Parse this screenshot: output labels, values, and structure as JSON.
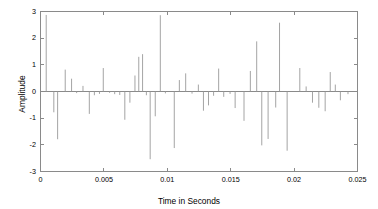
{
  "figure": {
    "background_color": "#ffffff",
    "axis_color": "#8a8a8a",
    "stem_color": "#9a9a9a",
    "text_color": "#3c3c3c"
  },
  "chart_data": {
    "type": "bar",
    "title": "",
    "subtitle": "",
    "xlabel": "Time in Seconds",
    "ylabel": "Amplitude",
    "xlim": [
      0,
      0.025
    ],
    "ylim": [
      -3,
      3
    ],
    "xticks": [
      0,
      0.005,
      0.01,
      0.015,
      0.02,
      0.025
    ],
    "xtick_labels": [
      "0",
      "0.005",
      "0.01",
      "0.015",
      "0.02",
      "0.025"
    ],
    "yticks": [
      -3,
      -2,
      -1,
      0,
      1,
      2,
      3
    ],
    "ytick_labels": [
      "-3",
      "-2",
      "-1",
      "0",
      "1",
      "2",
      "3"
    ],
    "grid": false,
    "legend": null,
    "legend_position": "none",
    "series_style": "stem-impulse",
    "x": [
      0.00045,
      0.00105,
      0.00135,
      0.00195,
      0.00245,
      0.00285,
      0.00335,
      0.00385,
      0.00425,
      0.00465,
      0.00495,
      0.00545,
      0.00585,
      0.00625,
      0.00665,
      0.00705,
      0.00745,
      0.00775,
      0.00805,
      0.00835,
      0.00865,
      0.00905,
      0.00945,
      0.00985,
      0.01055,
      0.01095,
      0.01145,
      0.01195,
      0.01245,
      0.01285,
      0.01325,
      0.01365,
      0.01405,
      0.01445,
      0.01495,
      0.01535,
      0.01605,
      0.01655,
      0.01705,
      0.01745,
      0.01795,
      0.01855,
      0.01885,
      0.01945,
      0.02045,
      0.02095,
      0.02145,
      0.02195,
      0.02245,
      0.02285,
      0.02325,
      0.02365,
      0.02425
    ],
    "values": [
      2.87,
      -0.78,
      -1.79,
      0.82,
      0.48,
      -0.06,
      0.21,
      -0.84,
      -0.14,
      -0.09,
      0.88,
      -0.05,
      -0.1,
      -0.13,
      -1.06,
      -0.42,
      0.6,
      1.3,
      1.4,
      -0.14,
      -2.54,
      -0.93,
      2.86,
      -0.07,
      -2.12,
      0.43,
      0.68,
      -0.08,
      0.26,
      -0.72,
      -0.52,
      -0.16,
      0.86,
      -0.2,
      -0.09,
      -0.62,
      -1.1,
      0.77,
      1.88,
      -2.02,
      -1.78,
      -0.6,
      2.58,
      -2.22,
      0.88,
      0.19,
      -0.42,
      -0.61,
      -0.74,
      0.73,
      0.26,
      -0.33,
      -0.1
    ],
    "value_range": {
      "min": -2.54,
      "max": 2.87
    }
  }
}
